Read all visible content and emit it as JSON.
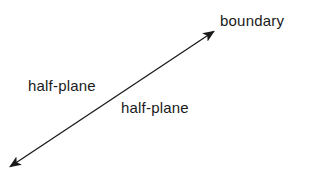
{
  "diagram": {
    "type": "line-with-two-arrowheads",
    "labels": {
      "boundary": "boundary",
      "half_plane_upper_left": "half-plane",
      "half_plane_lower_right": "half-plane"
    },
    "line": {
      "start": [
        8,
        168
      ],
      "end": [
        216,
        30
      ],
      "color": "#1a1a1a",
      "arrowheads": "both"
    }
  }
}
